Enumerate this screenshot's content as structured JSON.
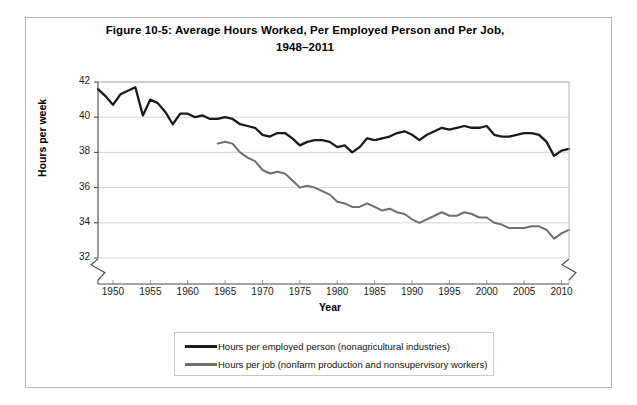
{
  "figure": {
    "title_line1": "Figure 10-5: Average Hours Worked, Per Employed Person and Per Job,",
    "title_line2": "1948–2011"
  },
  "chart_data": {
    "type": "line",
    "title": "Figure 10-5: Average Hours Worked, Per Employed Person and Per Job, 1948–2011",
    "xlabel": "Year",
    "ylabel": "Hours per week",
    "xlim": [
      1948,
      2011
    ],
    "ylim": [
      31,
      42
    ],
    "grid": true,
    "y_axis_break": true,
    "legend_position": "bottom",
    "xticks": [
      1950,
      1955,
      1960,
      1965,
      1970,
      1975,
      1980,
      1985,
      1990,
      1995,
      2000,
      2005,
      2010
    ],
    "yticks": [
      32,
      34,
      36,
      38,
      40,
      42
    ],
    "series": [
      {
        "name": "Hours per employed person (nonagricultural industries)",
        "color": "#1a1a1a",
        "x": [
          1948,
          1949,
          1950,
          1951,
          1952,
          1953,
          1954,
          1955,
          1956,
          1957,
          1958,
          1959,
          1960,
          1961,
          1962,
          1963,
          1964,
          1965,
          1966,
          1967,
          1968,
          1969,
          1970,
          1971,
          1972,
          1973,
          1974,
          1975,
          1976,
          1977,
          1978,
          1979,
          1980,
          1981,
          1982,
          1983,
          1984,
          1985,
          1986,
          1987,
          1988,
          1989,
          1990,
          1991,
          1992,
          1993,
          1994,
          1995,
          1996,
          1997,
          1998,
          1999,
          2000,
          2001,
          2002,
          2003,
          2004,
          2005,
          2006,
          2007,
          2008,
          2009,
          2010,
          2011
        ],
        "values": [
          41.6,
          41.2,
          40.7,
          41.3,
          41.5,
          41.7,
          40.1,
          41.0,
          40.8,
          40.3,
          39.6,
          40.2,
          40.2,
          40.0,
          40.1,
          39.9,
          39.9,
          40.0,
          39.9,
          39.6,
          39.5,
          39.4,
          39.0,
          38.9,
          39.1,
          39.1,
          38.8,
          38.4,
          38.6,
          38.7,
          38.7,
          38.6,
          38.3,
          38.4,
          38.0,
          38.3,
          38.8,
          38.7,
          38.8,
          38.9,
          39.1,
          39.2,
          39.0,
          38.7,
          39.0,
          39.2,
          39.4,
          39.3,
          39.4,
          39.5,
          39.4,
          39.4,
          39.5,
          39.0,
          38.9,
          38.9,
          39.0,
          39.1,
          39.1,
          39.0,
          38.6,
          37.8,
          38.1,
          38.2
        ]
      },
      {
        "name": "Hours per job (nonfarm production and nonsupervisory workers)",
        "color": "#6e6e6e",
        "x": [
          1964,
          1965,
          1966,
          1967,
          1968,
          1969,
          1970,
          1971,
          1972,
          1973,
          1974,
          1975,
          1976,
          1977,
          1978,
          1979,
          1980,
          1981,
          1982,
          1983,
          1984,
          1985,
          1986,
          1987,
          1988,
          1989,
          1990,
          1991,
          1992,
          1993,
          1994,
          1995,
          1996,
          1997,
          1998,
          1999,
          2000,
          2001,
          2002,
          2003,
          2004,
          2005,
          2006,
          2007,
          2008,
          2009,
          2010,
          2011
        ],
        "values": [
          38.5,
          38.6,
          38.5,
          38.0,
          37.7,
          37.5,
          37.0,
          36.8,
          36.9,
          36.8,
          36.4,
          36.0,
          36.1,
          36.0,
          35.8,
          35.6,
          35.2,
          35.1,
          34.9,
          34.9,
          35.1,
          34.9,
          34.7,
          34.8,
          34.6,
          34.5,
          34.2,
          34.0,
          34.2,
          34.4,
          34.6,
          34.4,
          34.4,
          34.6,
          34.5,
          34.3,
          34.3,
          34.0,
          33.9,
          33.7,
          33.7,
          33.7,
          33.8,
          33.8,
          33.6,
          33.1,
          33.4,
          33.6
        ]
      }
    ]
  }
}
